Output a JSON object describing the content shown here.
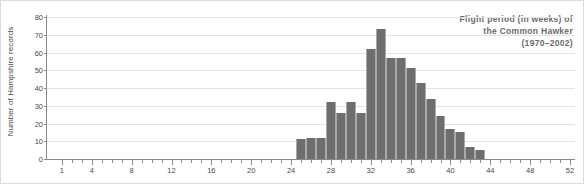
{
  "chart_data": {
    "type": "bar",
    "title": "Flight period (in weeks) of the Common Hawker (1970–2002)",
    "title_lines": [
      "Flight period (in weeks) of",
      "the Common Hawker",
      "(1970–2002)"
    ],
    "xlabel": "",
    "ylabel": "Number of Hampshire records",
    "ylim": [
      0,
      80
    ],
    "xlim": [
      0,
      53
    ],
    "ytick_values": [
      0,
      10,
      20,
      30,
      40,
      50,
      60,
      70,
      80
    ],
    "ytick_labels": [
      "0",
      "10",
      "20",
      "30",
      "40",
      "50",
      "60",
      "70",
      "80"
    ],
    "xtick_values": [
      1,
      4,
      8,
      12,
      16,
      20,
      24,
      28,
      32,
      36,
      40,
      44,
      48,
      52
    ],
    "xtick_labels": [
      "1",
      "4",
      "8",
      "12",
      "16",
      "20",
      "24",
      "28",
      "32",
      "36",
      "40",
      "44",
      "48",
      "52"
    ],
    "grid": true,
    "legend": "none",
    "bar_color": "#6e6e6e",
    "categories": [
      25,
      26,
      27,
      28,
      29,
      30,
      31,
      32,
      33,
      34,
      35,
      36,
      37,
      38,
      39,
      40,
      41,
      42,
      43
    ],
    "values": [
      11,
      12,
      12,
      32,
      26,
      32,
      26,
      62,
      73,
      57,
      57,
      51,
      43,
      34,
      24,
      17,
      15,
      7,
      5
    ],
    "series": [
      {
        "name": "Hampshire records",
        "values": [
          11,
          12,
          12,
          32,
          26,
          32,
          26,
          62,
          73,
          57,
          57,
          51,
          43,
          34,
          24,
          17,
          15,
          7,
          5
        ]
      }
    ],
    "points": [
      {
        "week": 25,
        "records": 11
      },
      {
        "week": 26,
        "records": 12
      },
      {
        "week": 27,
        "records": 12
      },
      {
        "week": 28,
        "records": 32
      },
      {
        "week": 29,
        "records": 26
      },
      {
        "week": 30,
        "records": 32
      },
      {
        "week": 31,
        "records": 26
      },
      {
        "week": 32,
        "records": 62
      },
      {
        "week": 33,
        "records": 73
      },
      {
        "week": 34,
        "records": 57
      },
      {
        "week": 35,
        "records": 57
      },
      {
        "week": 36,
        "records": 51
      },
      {
        "week": 37,
        "records": 43
      },
      {
        "week": 38,
        "records": 34
      },
      {
        "week": 39,
        "records": 24
      },
      {
        "week": 40,
        "records": 17
      },
      {
        "week": 41,
        "records": 15
      },
      {
        "week": 42,
        "records": 7
      },
      {
        "week": 43,
        "records": 5
      }
    ]
  }
}
